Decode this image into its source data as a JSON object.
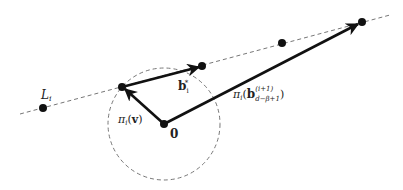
{
  "diagram": {
    "line_label": "L",
    "line_label_sub": "i",
    "origin_label": "0",
    "vector_v_label": {
      "pi": "π",
      "pi_sub": "i",
      "open": "(",
      "arg": "v",
      "close": ")"
    },
    "vector_b_label": {
      "b": "b",
      "sub": "i",
      "sup": "*"
    },
    "vector_long_label": {
      "pi": "π",
      "pi_sub": "i",
      "open": "(",
      "b": "b",
      "sup": "(i+1)",
      "sub": "d−β+1",
      "close": ")"
    },
    "colors": {
      "stroke": "#111111",
      "dashed": "#777777",
      "text": "#222222"
    }
  }
}
